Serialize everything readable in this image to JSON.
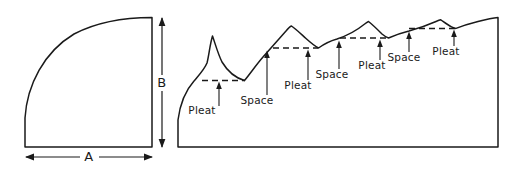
{
  "figure": {
    "background_color": "#ffffff",
    "ink_color": "#1a1a1a",
    "width": 521,
    "height": 169
  },
  "left_figure": {
    "name": "quarter-ellipse-panel",
    "description": "Quarter ellipse flat panel outline with horizontal and vertical dimension arrows",
    "dimensions": [
      {
        "id": "width-dimension",
        "label": "A",
        "orientation": "horizontal",
        "label_x": 89,
        "label_y": 161,
        "line_y": 157,
        "start_x": 26,
        "end_x": 152
      },
      {
        "id": "height-dimension",
        "label": "B",
        "orientation": "vertical",
        "label_x": 162,
        "label_y": 87,
        "line_x": 162,
        "start_y": 18,
        "end_y": 147
      }
    ],
    "outline_path": "M 25 147 L 25 118 C 27 85 44 52 74 34 C 99 21 126 17.5 152 17.5 L 152 147 Z"
  },
  "right_figure": {
    "name": "pleated-panel-profile",
    "description": "Pleated panel with four pleat and space pairs along a scalloped upper edge",
    "baseline_y": 147,
    "left_x": 178,
    "right_x": 498,
    "top_right_y": 17,
    "outline_path": "M 178 147 L 178 120 C 180 104 186 90 194 81 C 199 75 204 70 207 63 C 209 55 210 44 212.5 36 C 215 43 218 54 222 62 C 228 72 236 78 244.5 80.5 C 250 74 256 65 263 57 C 270 49 278 40 286 31 C 288 28.5 290 26.5 291.5 26 C 296 29 301 34 306 38.5 C 311 43 315.5 46.5 318.5 48 C 324 44 330 41 337 39 C 346 36 356 31 364 24.5 C 366 23 367.5 22 368.5 21.5 C 373 25 378 30 382 34 C 385 36.5 387 37.6 388.5 38 C 394 35.5 401 33 409 31 C 418 28.5 428 25 436 21.5 C 438.5 20.5 440 20 440.8 19.8 C 444 22 448 25 451.5 26.8 C 453.5 27.8 455 28.3 456 28.4 C 462 26 470 23.5 478 21.5 C 486 19.5 493 18 498 17.5 L 498 147 Z",
    "chords": [
      {
        "id": "chord-1",
        "x1": 202,
        "x2": 245,
        "y": 80.5
      },
      {
        "id": "chord-2",
        "x1": 273,
        "x2": 318,
        "y": 48
      },
      {
        "id": "chord-3",
        "x1": 340,
        "x2": 389,
        "y": 38
      },
      {
        "id": "chord-4",
        "x1": 409,
        "x2": 457,
        "y": 28.5
      }
    ],
    "callouts": [
      {
        "id": "callout-pleat-1",
        "label": "Pleat",
        "label_x": 202,
        "label_y": 114,
        "arrow_x": 219,
        "arrow_tail_y": 106,
        "arrow_tip_y": 83
      },
      {
        "id": "callout-space-1",
        "label": "Space",
        "label_x": 257,
        "label_y": 104,
        "arrow_x": 267,
        "arrow_tail_y": 95,
        "arrow_tip_y": 52
      },
      {
        "id": "callout-pleat-2",
        "label": "Pleat",
        "label_x": 298,
        "label_y": 89,
        "arrow_x": 308,
        "arrow_tail_y": 80,
        "arrow_tip_y": 51
      },
      {
        "id": "callout-space-2",
        "label": "Space",
        "label_x": 332,
        "label_y": 78,
        "arrow_x": 339,
        "arrow_tail_y": 69,
        "arrow_tip_y": 42
      },
      {
        "id": "callout-pleat-3",
        "label": "Pleat",
        "label_x": 372,
        "label_y": 69,
        "arrow_x": 380,
        "arrow_tail_y": 60,
        "arrow_tip_y": 41
      },
      {
        "id": "callout-space-3",
        "label": "Space",
        "label_x": 404,
        "label_y": 61,
        "arrow_x": 409,
        "arrow_tail_y": 52,
        "arrow_tip_y": 33
      },
      {
        "id": "callout-pleat-4",
        "label": "Pleat",
        "label_x": 446,
        "label_y": 55,
        "arrow_x": 454,
        "arrow_tail_y": 46,
        "arrow_tip_y": 31
      },
      {
        "id": "callout-space-4",
        "label": "Space",
        "label_x": 489,
        "label_y": 48,
        "arrow_x": 493,
        "arrow_tail_y": 40,
        "arrow_tip_y": 24
      }
    ]
  }
}
